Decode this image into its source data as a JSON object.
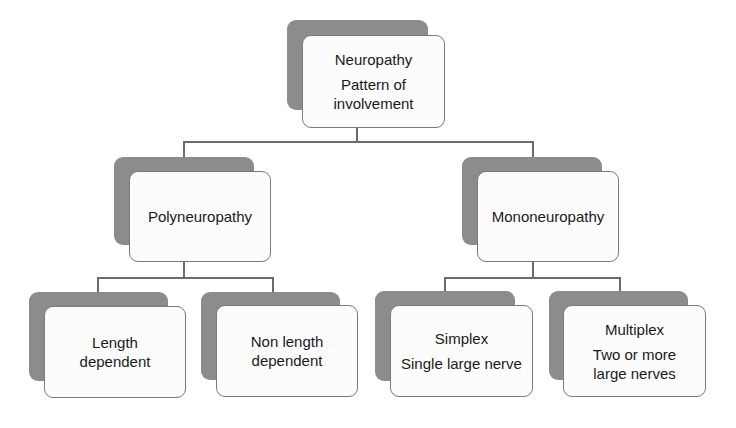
{
  "diagram": {
    "type": "hierarchy",
    "root": {
      "title": "Neuropathy",
      "subtitle_line1": "Pattern of",
      "subtitle_line2": "involvement"
    },
    "level2": [
      {
        "id": "poly",
        "label": "Polyneuropathy"
      },
      {
        "id": "mono",
        "label": "Mononeuropathy"
      }
    ],
    "level3": [
      {
        "parent": "poly",
        "line1": "Length",
        "line2": "dependent"
      },
      {
        "parent": "poly",
        "line1": "Non length",
        "line2": "dependent"
      },
      {
        "parent": "mono",
        "title": "Simplex",
        "line1": "Single large nerve"
      },
      {
        "parent": "mono",
        "title": "Multiplex",
        "line1": "Two or more",
        "line2": "large nerves"
      }
    ]
  },
  "colors": {
    "shadow": "#8c8c8c",
    "box_fill": "#fcfcfc",
    "box_border": "#7a7a7a",
    "connector": "#6b6b6b",
    "text": "#1a1a1a"
  }
}
